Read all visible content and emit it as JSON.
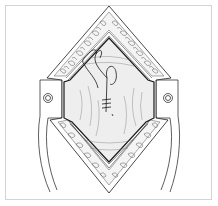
{
  "figure": {
    "kind": "surgical-line-illustration",
    "caption": "",
    "colors": {
      "ink": "#1a1a1a",
      "frame": "#d4d4d4",
      "background": "#ffffff",
      "tissue_shade": "#e8e8e8"
    }
  }
}
